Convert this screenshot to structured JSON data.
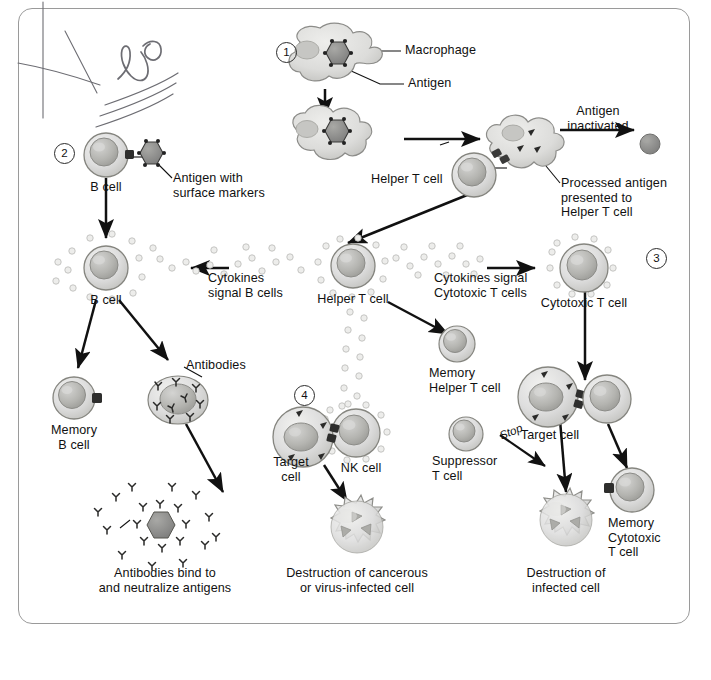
{
  "figure": {
    "type": "biology-flow-diagram",
    "page_background": "#ffffff",
    "border_color": "#9a9a9a"
  },
  "annotation": {
    "handwriting_text": "NO",
    "marks": [
      "x-mark",
      "vertical-rule",
      "three-underlines"
    ]
  },
  "steps": [
    {
      "id": 1,
      "label": "1",
      "x": 285,
      "y": 51
    },
    {
      "id": 2,
      "label": "2",
      "x": 63,
      "y": 152
    },
    {
      "id": 3,
      "label": "3",
      "x": 655,
      "y": 257
    },
    {
      "id": 4,
      "label": "4",
      "x": 303,
      "y": 394
    }
  ],
  "labels": {
    "macrophage": "Macrophage",
    "antigen": "Antigen",
    "antigen_inactivated": "Antigen\ninactivated",
    "processed_antigen": "Processed antigen\npresented to\nHelper T cell",
    "helper_t_cell_top": "Helper T cell",
    "b_cell_top": "B cell",
    "antigen_surface_markers": "Antigen with\nsurface markers",
    "b_cell_mid": "B cell",
    "cytokines_signal_b": "Cytokines\nsignal B cells",
    "helper_t_cell_mid": "Helper T cell",
    "cytokines_signal_ctl": "Cytokines signal\nCytotoxic T cells",
    "cytotoxic_t_cell": "Cytotoxic T cell",
    "memory_b_cell": "Memory\nB cell",
    "antibodies": "Antibodies",
    "memory_helper_t_cell": "Memory\nHelper T cell",
    "nk_cell": "NK cell",
    "target_cell_left": "Target\ncell",
    "target_cell_right": "Target cell",
    "suppressor_t_cell": "Suppressor\nT cell",
    "stop": "Stop",
    "memory_cytotoxic_t_cell": "Memory\nCytotoxic\nT cell",
    "antibodies_bind": "Antibodies bind to\nand neutralize antigens",
    "destruction_cancerous": "Destruction of cancerous\nor virus-infected cell",
    "destruction_infected": "Destruction of\ninfected cell"
  },
  "colors": {
    "cell_fill_light": "#e2e2e0",
    "cell_fill_mid": "#cfcfcc",
    "nucleus": "#b6b6b2",
    "antigen": "#8d8d8a",
    "outline": "#7d7d7a",
    "arrow": "#111111",
    "cytokine": "#d6d6d4",
    "handwriting": "#6d6d73"
  }
}
